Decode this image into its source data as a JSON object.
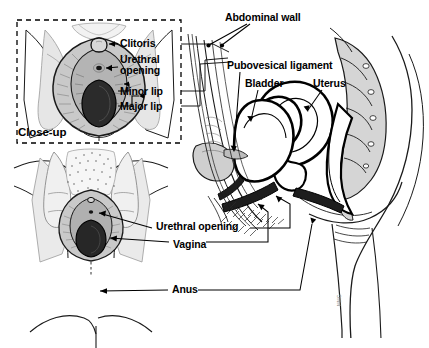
{
  "figure": {
    "credit": "MMG"
  },
  "inset": {
    "caption": "Close-up",
    "labels": {
      "clitoris": "Clitoris",
      "urethral_opening_line1": "Urethral",
      "urethral_opening_line2": "opening",
      "minor_lip": "Minor lip",
      "major_lip": "Major lip"
    }
  },
  "sagittal": {
    "labels": {
      "abdominal_wall": "Abdominal wall",
      "pubovesical_ligament": "Pubovesical ligament",
      "bladder": "Bladder",
      "uterus": "Uterus"
    }
  },
  "perineal": {
    "labels": {
      "urethral_opening": "Urethral opening",
      "vagina": "Vagina",
      "anus": "Anus"
    }
  },
  "colors": {
    "ink": "#000000",
    "line": "#1a1a1a",
    "tissue_light": "#e3e3e3",
    "tissue_mid": "#c2c2c2",
    "tissue_dark": "#8d8d8d",
    "cavity": "#2b2b2b",
    "background": "#ffffff"
  }
}
